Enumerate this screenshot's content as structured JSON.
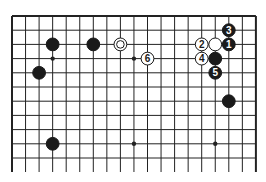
{
  "board": {
    "columns": 19,
    "visible_rows": 11,
    "origin_x": 12,
    "origin_y": 16,
    "spacing_x": 13.55,
    "spacing_y": 14.2,
    "line_color": "#222222",
    "bottom_open_to_y": 172
  },
  "hoshi": [
    [
      3,
      3
    ],
    [
      9,
      3
    ],
    [
      15,
      3
    ],
    [
      3,
      9
    ],
    [
      9,
      9
    ],
    [
      15,
      9
    ]
  ],
  "stones": [
    {
      "color": "black",
      "col": 3,
      "row": 2,
      "label": ""
    },
    {
      "color": "black",
      "col": 6,
      "row": 2,
      "label": ""
    },
    {
      "color": "white",
      "col": 8,
      "row": 2,
      "label": "",
      "marker": "double-circle"
    },
    {
      "color": "black",
      "col": 2,
      "row": 4,
      "label": ""
    },
    {
      "color": "black",
      "col": 16,
      "row": 1,
      "label": "3"
    },
    {
      "color": "black",
      "col": 16,
      "row": 2,
      "label": "1"
    },
    {
      "color": "white",
      "col": 15,
      "row": 2,
      "label": ""
    },
    {
      "color": "white",
      "col": 14,
      "row": 2,
      "label": "2"
    },
    {
      "color": "white",
      "col": 14,
      "row": 3,
      "label": "4"
    },
    {
      "color": "black",
      "col": 15,
      "row": 3,
      "label": ""
    },
    {
      "color": "black",
      "col": 15,
      "row": 4,
      "label": "5"
    },
    {
      "color": "white",
      "col": 10,
      "row": 3,
      "label": "6"
    },
    {
      "color": "black",
      "col": 16,
      "row": 6,
      "label": ""
    },
    {
      "color": "black",
      "col": 3,
      "row": 9,
      "label": ""
    }
  ]
}
